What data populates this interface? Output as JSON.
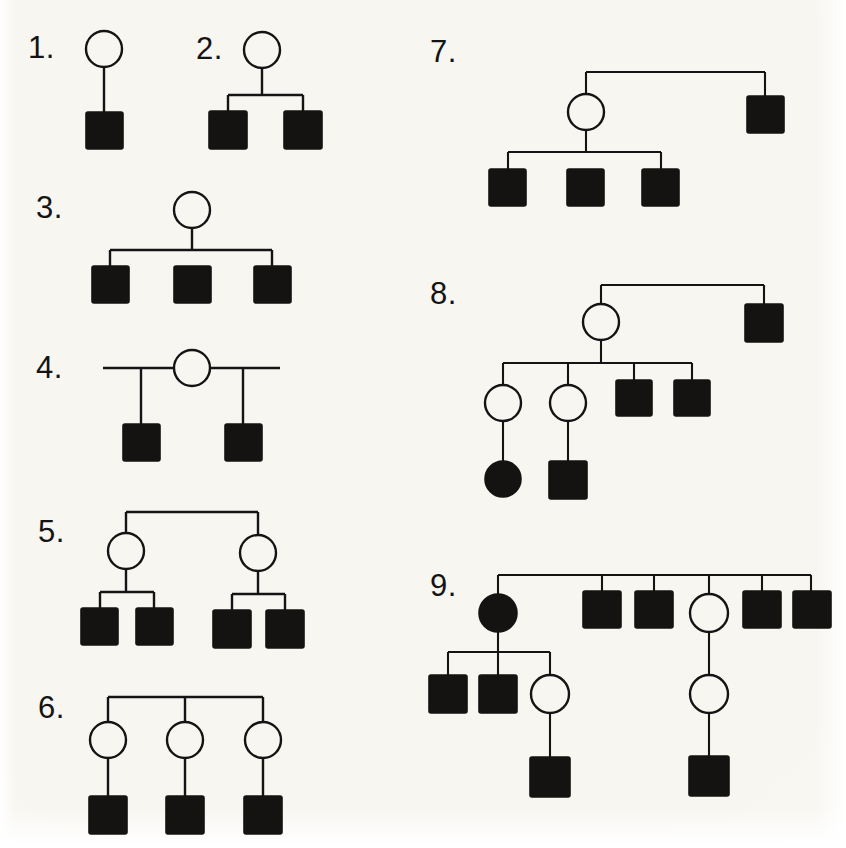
{
  "document": {
    "kind": "pedigree-chart-worksheet",
    "background_color": "#f8f6f1",
    "ink_color": "#141414",
    "symbol_legend": {
      "open_circle": "unaffected female",
      "filled_circle": "affected female",
      "open_square": "unaffected male",
      "filled_square": "affected male"
    }
  },
  "labels": {
    "p1": "1.",
    "p2": "2.",
    "p3": "3.",
    "p4": "4.",
    "p5": "5.",
    "p6": "6.",
    "p7": "7.",
    "p8": "8.",
    "p9": "9."
  },
  "pedigrees": [
    {
      "id": "pedigree-1",
      "label": "1.",
      "individual_count": 2,
      "generations": 2,
      "individuals": [
        {
          "id": "p1-i1",
          "shape": "circle",
          "fill": "open",
          "sex": "female",
          "gen": 1,
          "cx": 104,
          "cy": 49
        },
        {
          "id": "p1-i2",
          "shape": "square",
          "fill": "filled",
          "sex": "male",
          "gen": 2,
          "cx": 104,
          "cy": 130
        }
      ]
    },
    {
      "id": "pedigree-2",
      "label": "2.",
      "individual_count": 3,
      "generations": 2,
      "individuals": [
        {
          "id": "p2-i1",
          "shape": "circle",
          "fill": "open",
          "sex": "female",
          "gen": 1,
          "cx": 262,
          "cy": 50
        },
        {
          "id": "p2-i2",
          "shape": "square",
          "fill": "filled",
          "sex": "male",
          "gen": 2,
          "cx": 228,
          "cy": 129
        },
        {
          "id": "p2-i3",
          "shape": "square",
          "fill": "filled",
          "sex": "male",
          "gen": 2,
          "cx": 303,
          "cy": 129
        }
      ]
    },
    {
      "id": "pedigree-3",
      "label": "3.",
      "individual_count": 4,
      "generations": 2,
      "individuals": [
        {
          "id": "p3-i1",
          "shape": "circle",
          "fill": "open",
          "sex": "female",
          "gen": 1,
          "cx": 192,
          "cy": 210
        },
        {
          "id": "p3-i2",
          "shape": "square",
          "fill": "filled",
          "sex": "male",
          "gen": 2,
          "cx": 110,
          "cy": 283
        },
        {
          "id": "p3-i3",
          "shape": "square",
          "fill": "filled",
          "sex": "male",
          "gen": 2,
          "cx": 192,
          "cy": 283
        },
        {
          "id": "p3-i4",
          "shape": "square",
          "fill": "filled",
          "sex": "male",
          "gen": 2,
          "cx": 272,
          "cy": 283
        }
      ]
    },
    {
      "id": "pedigree-4",
      "label": "4.",
      "individual_count": 3,
      "generations": 2,
      "individuals": [
        {
          "id": "p4-i1",
          "shape": "circle",
          "fill": "open",
          "sex": "female",
          "gen": 1,
          "cx": 192,
          "cy": 368
        },
        {
          "id": "p4-i2",
          "shape": "square",
          "fill": "filled",
          "sex": "male",
          "gen": 2,
          "cx": 141,
          "cy": 442
        },
        {
          "id": "p4-i3",
          "shape": "square",
          "fill": "filled",
          "sex": "male",
          "gen": 2,
          "cx": 243,
          "cy": 442
        }
      ]
    },
    {
      "id": "pedigree-5",
      "label": "5.",
      "individual_count": 6,
      "generations": 3,
      "individuals": [
        {
          "id": "p5-i1",
          "shape": "circle",
          "fill": "open",
          "sex": "female",
          "gen": 2,
          "cx": 126,
          "cy": 551
        },
        {
          "id": "p5-i2",
          "shape": "circle",
          "fill": "open",
          "sex": "female",
          "gen": 2,
          "cx": 258,
          "cy": 553
        },
        {
          "id": "p5-i3",
          "shape": "square",
          "fill": "filled",
          "sex": "male",
          "gen": 3,
          "cx": 100,
          "cy": 625
        },
        {
          "id": "p5-i4",
          "shape": "square",
          "fill": "filled",
          "sex": "male",
          "gen": 3,
          "cx": 154,
          "cy": 625
        },
        {
          "id": "p5-i5",
          "shape": "square",
          "fill": "filled",
          "sex": "male",
          "gen": 3,
          "cx": 232,
          "cy": 627
        },
        {
          "id": "p5-i6",
          "shape": "square",
          "fill": "filled",
          "sex": "male",
          "gen": 3,
          "cx": 285,
          "cy": 627
        }
      ]
    },
    {
      "id": "pedigree-6",
      "label": "6.",
      "individual_count": 6,
      "generations": 3,
      "individuals": [
        {
          "id": "p6-i1",
          "shape": "circle",
          "fill": "open",
          "sex": "female",
          "gen": 2,
          "cx": 108,
          "cy": 740
        },
        {
          "id": "p6-i2",
          "shape": "circle",
          "fill": "open",
          "sex": "female",
          "gen": 2,
          "cx": 185,
          "cy": 740
        },
        {
          "id": "p6-i3",
          "shape": "circle",
          "fill": "open",
          "sex": "female",
          "gen": 2,
          "cx": 263,
          "cy": 740
        },
        {
          "id": "p6-i4",
          "shape": "square",
          "fill": "filled",
          "sex": "male",
          "gen": 3,
          "cx": 108,
          "cy": 814
        },
        {
          "id": "p6-i5",
          "shape": "square",
          "fill": "filled",
          "sex": "male",
          "gen": 3,
          "cx": 185,
          "cy": 814
        },
        {
          "id": "p6-i6",
          "shape": "square",
          "fill": "filled",
          "sex": "male",
          "gen": 3,
          "cx": 263,
          "cy": 814
        }
      ]
    },
    {
      "id": "pedigree-7",
      "label": "7.",
      "individual_count": 5,
      "generations": 3,
      "individuals": [
        {
          "id": "p7-i1",
          "shape": "circle",
          "fill": "open",
          "sex": "female",
          "gen": 2,
          "cx": 586,
          "cy": 112
        },
        {
          "id": "p7-i2",
          "shape": "square",
          "fill": "filled",
          "sex": "male",
          "gen": 2,
          "cx": 765,
          "cy": 114
        },
        {
          "id": "p7-i3",
          "shape": "square",
          "fill": "filled",
          "sex": "male",
          "gen": 3,
          "cx": 508,
          "cy": 186
        },
        {
          "id": "p7-i4",
          "shape": "square",
          "fill": "filled",
          "sex": "male",
          "gen": 3,
          "cx": 586,
          "cy": 186
        },
        {
          "id": "p7-i5",
          "shape": "square",
          "fill": "filled",
          "sex": "male",
          "gen": 3,
          "cx": 661,
          "cy": 186
        }
      ]
    },
    {
      "id": "pedigree-8",
      "label": "8.",
      "individual_count": 8,
      "generations": 4,
      "individuals": [
        {
          "id": "p8-i1",
          "shape": "circle",
          "fill": "open",
          "sex": "female",
          "gen": 2,
          "cx": 601,
          "cy": 322
        },
        {
          "id": "p8-i2",
          "shape": "square",
          "fill": "filled",
          "sex": "male",
          "gen": 2,
          "cx": 764,
          "cy": 322
        },
        {
          "id": "p8-i3",
          "shape": "circle",
          "fill": "open",
          "sex": "female",
          "gen": 3,
          "cx": 503,
          "cy": 403
        },
        {
          "id": "p8-i4",
          "shape": "circle",
          "fill": "open",
          "sex": "female",
          "gen": 3,
          "cx": 568,
          "cy": 403
        },
        {
          "id": "p8-i5",
          "shape": "square",
          "fill": "filled",
          "sex": "male",
          "gen": 3,
          "cx": 634,
          "cy": 398
        },
        {
          "id": "p8-i6",
          "shape": "square",
          "fill": "filled",
          "sex": "male",
          "gen": 3,
          "cx": 692,
          "cy": 398
        },
        {
          "id": "p8-i7",
          "shape": "circle",
          "fill": "filled",
          "sex": "female",
          "gen": 4,
          "cx": 503,
          "cy": 479
        },
        {
          "id": "p8-i8",
          "shape": "square",
          "fill": "filled",
          "sex": "male",
          "gen": 4,
          "cx": 568,
          "cy": 479
        }
      ]
    },
    {
      "id": "pedigree-9",
      "label": "9.",
      "individual_count": 12,
      "generations": 4,
      "individuals": [
        {
          "id": "p9-i1",
          "shape": "circle",
          "fill": "filled",
          "sex": "female",
          "gen": 2,
          "cx": 498,
          "cy": 613
        },
        {
          "id": "p9-i2",
          "shape": "square",
          "fill": "filled",
          "sex": "male",
          "gen": 2,
          "cx": 602,
          "cy": 609
        },
        {
          "id": "p9-i3",
          "shape": "square",
          "fill": "filled",
          "sex": "male",
          "gen": 2,
          "cx": 654,
          "cy": 609
        },
        {
          "id": "p9-i4",
          "shape": "circle",
          "fill": "open",
          "sex": "female",
          "gen": 2,
          "cx": 709,
          "cy": 613
        },
        {
          "id": "p9-i5",
          "shape": "square",
          "fill": "filled",
          "sex": "male",
          "gen": 2,
          "cx": 762,
          "cy": 609
        },
        {
          "id": "p9-i6",
          "shape": "square",
          "fill": "filled",
          "sex": "male",
          "gen": 2,
          "cx": 811,
          "cy": 609
        },
        {
          "id": "p9-i7",
          "shape": "square",
          "fill": "filled",
          "sex": "male",
          "gen": 3,
          "cx": 448,
          "cy": 692
        },
        {
          "id": "p9-i8",
          "shape": "square",
          "fill": "filled",
          "sex": "male",
          "gen": 3,
          "cx": 498,
          "cy": 692
        },
        {
          "id": "p9-i9",
          "shape": "circle",
          "fill": "open",
          "sex": "female",
          "gen": 3,
          "cx": 550,
          "cy": 694
        },
        {
          "id": "p9-i10",
          "shape": "circle",
          "fill": "open",
          "sex": "female",
          "gen": 3,
          "cx": 709,
          "cy": 694
        },
        {
          "id": "p9-i11",
          "shape": "square",
          "fill": "filled",
          "sex": "male",
          "gen": 4,
          "cx": 550,
          "cy": 775
        },
        {
          "id": "p9-i12",
          "shape": "square",
          "fill": "filled",
          "sex": "male",
          "gen": 4,
          "cx": 709,
          "cy": 775
        }
      ]
    }
  ],
  "label_positions": {
    "p1": {
      "x": 28,
      "y": 32
    },
    "p2": {
      "x": 196,
      "y": 33
    },
    "p3": {
      "x": 36,
      "y": 192
    },
    "p4": {
      "x": 36,
      "y": 352
    },
    "p5": {
      "x": 38,
      "y": 516
    },
    "p6": {
      "x": 38,
      "y": 692
    },
    "p7": {
      "x": 430,
      "y": 36
    },
    "p8": {
      "x": 430,
      "y": 278
    },
    "p9": {
      "x": 430,
      "y": 570
    }
  }
}
